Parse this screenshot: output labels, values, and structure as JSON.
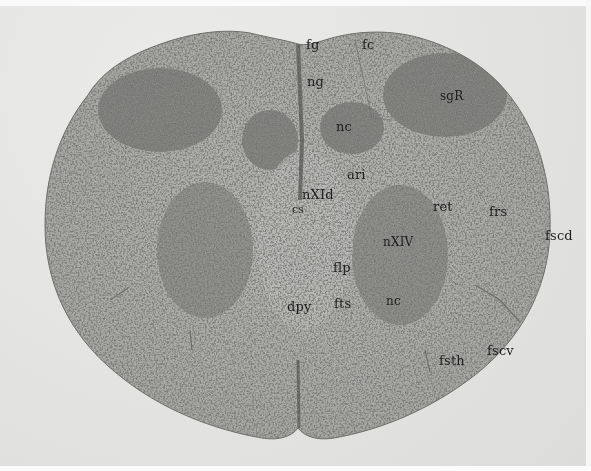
{
  "figure": {
    "colors": {
      "background": "#e4e4e2",
      "white_matter": "#a9a9a6",
      "gray_matter_dark": "#4a4a48",
      "label_text": "#1e1e1e"
    },
    "labels": [
      {
        "id": "fg",
        "text": "fg",
        "x": 313,
        "y": 38
      },
      {
        "id": "fc",
        "text": "fc",
        "x": 366,
        "y": 46
      },
      {
        "id": "ng",
        "text": "ng",
        "x": 311,
        "y": 78
      },
      {
        "id": "sgR",
        "text": "sgR",
        "x": 441,
        "y": 93
      },
      {
        "id": "nc-upper",
        "text": "nc",
        "x": 337,
        "y": 123
      },
      {
        "id": "ari",
        "text": "ari",
        "x": 347,
        "y": 171
      },
      {
        "id": "nXId",
        "text": "nXId",
        "x": 302,
        "y": 192
      },
      {
        "id": "cs",
        "text": "cs",
        "x": 292,
        "y": 207
      },
      {
        "id": "ret",
        "text": "ret",
        "x": 433,
        "y": 203
      },
      {
        "id": "frs",
        "text": "frs",
        "x": 490,
        "y": 208
      },
      {
        "id": "fscd",
        "text": "fscd",
        "x": 545,
        "y": 232
      },
      {
        "id": "nXIV",
        "text": "nXIV",
        "x": 383,
        "y": 239
      },
      {
        "id": "flp",
        "text": "flp",
        "x": 334,
        "y": 264
      },
      {
        "id": "dpy",
        "text": "dpy",
        "x": 287,
        "y": 303
      },
      {
        "id": "fts",
        "text": "fts",
        "x": 334,
        "y": 300
      },
      {
        "id": "nc-lower",
        "text": "nc",
        "x": 386,
        "y": 298
      },
      {
        "id": "fsth",
        "text": "fsth",
        "x": 440,
        "y": 357
      },
      {
        "id": "fscv",
        "text": "fscv",
        "x": 487,
        "y": 347
      }
    ]
  }
}
